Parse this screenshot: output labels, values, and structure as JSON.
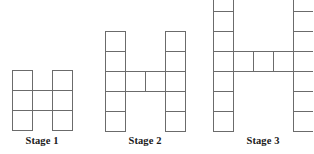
{
  "figure": {
    "type": "geometric-pattern-sequence",
    "background_color": "#ffffff",
    "stroke_color": "#6b6b6b",
    "label_color": "#1a1a1a",
    "cell_size_px": 20
  },
  "stages": [
    {
      "label": "Stage 1",
      "column_cells": 3,
      "crossbar_cells": 1,
      "crossbar_row_index": 1,
      "total_squares": 7,
      "origin_x": 12,
      "origin_y": 70,
      "label_left": 12,
      "label_top": 135
    },
    {
      "label": "Stage 2",
      "column_cells": 5,
      "crossbar_cells": 2,
      "crossbar_row_index": 2,
      "total_squares": 12,
      "origin_x": 105,
      "origin_y": 31,
      "label_left": 105,
      "label_top": 135
    },
    {
      "label": "Stage 3",
      "column_cells": 7,
      "crossbar_cells": 3,
      "crossbar_row_index": 3,
      "total_squares": 17,
      "origin_x": 213,
      "origin_y": -9,
      "label_left": 213,
      "label_top": 135
    }
  ]
}
